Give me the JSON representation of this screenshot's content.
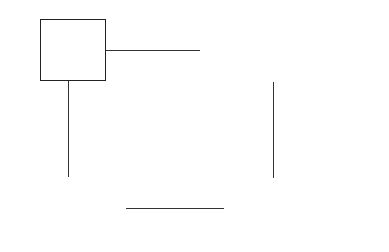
{
  "boxes": {
    "original": {
      "line1": "Original",
      "line2": "problems"
    },
    "approx": {
      "line1": "Approximation  problems",
      "line2": "in image space of BPO"
    },
    "solutions": {
      "line1": "The solutions   of",
      "line2": "original problems"
    },
    "solve": {
      "line1": "Solve the approximation",
      "line2": "problems"
    }
  },
  "edges": {
    "top": {
      "label1": "B",
      "label2": "(BPO)"
    },
    "bottom": {
      "label1": "Convergence",
      "label2": "(equivalence)"
    }
  }
}
